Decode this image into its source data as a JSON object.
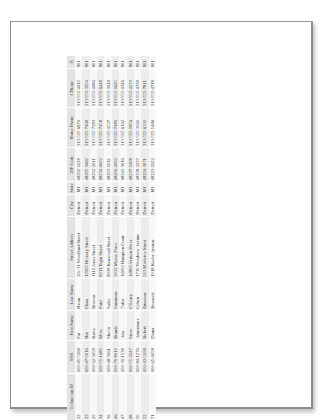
{
  "document": {
    "table": {
      "columns": [
        "Technician ID",
        "SSN",
        "First Name",
        "Last Name",
        "Street Address",
        "City",
        "State",
        "ZIP Code",
        "Home Phone",
        "CPhone",
        "⎘"
      ],
      "rows": [
        [
          "22",
          "000-45-5368",
          "Pat",
          "Hwan",
          "20c 31 Woodland Street",
          "Detroit",
          "MI",
          "48202-1138",
          "313-555-6874",
          "313-555-4412",
          "801"
        ],
        [
          "23",
          "000-47-5016",
          "Hui",
          "Chan",
          "12905 Hickory Street",
          "Detroit",
          "MI",
          "48205-3462",
          "313-555-7468",
          "313-555-3254",
          "801"
        ],
        [
          "29",
          "000-62-3458",
          "Karla",
          "Browne",
          "1111 Jones Street",
          "Detroit",
          "MI",
          "48202-2011",
          "313-555-7283",
          "313-555-4486",
          "801"
        ],
        [
          "34",
          "000-55-1480",
          "Mike",
          "Patel",
          "8211 Elgin Street",
          "Detroit",
          "MI",
          "48234-4002",
          "313-555-7458",
          "313-555-6248",
          "801"
        ],
        [
          "39",
          "000-48-3961",
          "Sheila",
          "Salko",
          "8938 Kenwood Street",
          "Detroit",
          "MI",
          "48203-1112",
          "313-555-4537",
          "313-555-3618",
          "801"
        ],
        [
          "46",
          "000-70-8412",
          "Brandi",
          "Simmons",
          "3032 Moose Place",
          "Detroit",
          "MI",
          "48209-2002",
          "313-555-7489",
          "313-555-9625",
          "801"
        ],
        [
          "47",
          "000-31-1538",
          "Ana",
          "Tabor",
          "14002 Hampton Court",
          "Detroit",
          "MI",
          "48221-3016",
          "313-555-6142",
          "313-555-4346",
          "801"
        ],
        [
          "48",
          "000-55-2247",
          "Steve",
          "O'Leary",
          "14800 Vernon Drive",
          "Detroit",
          "MI",
          "48237-1208",
          "313-555-9856",
          "313-555-4233",
          "801"
        ],
        [
          "50",
          "000-84-1274",
          "Annemarie",
          "Cohen",
          "1730 Woodrow Avenue",
          "Detroit",
          "MI",
          "48238-2237",
          "313-555-3941",
          "313-555-4798",
          "801"
        ],
        [
          "52",
          "000-43-5198",
          "Robert",
          "Emerson",
          "503 Mistletoe Street",
          "Detroit",
          "MI",
          "48204-3071",
          "313-555-6331",
          "313-555-7811",
          "801"
        ],
        [
          "71",
          "000-65-4058",
          "Diana",
          "Rosenski",
          "1918 Keeler Avenue",
          "Detroit",
          "MI",
          "48223-1122",
          "313-555-5486",
          "313-555-4718",
          "801"
        ]
      ]
    },
    "colors": {
      "header_bg": "#e3e3e3",
      "row_alt_bg": "#ececec",
      "row_bg": "#f8f8f8",
      "page_border": "#8c8c8c"
    }
  }
}
